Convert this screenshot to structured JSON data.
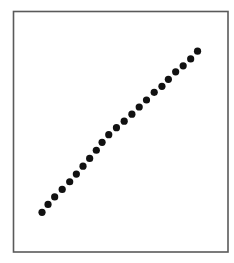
{
  "chart_data": {
    "type": "scatter",
    "title": "",
    "xlabel": "",
    "ylabel": "",
    "x_ticks": [],
    "y_ticks": [],
    "legend": [],
    "grid": false,
    "xlim": [
      0,
      1
    ],
    "ylim": [
      0,
      1
    ],
    "note": "No axes, ticks or labels are shown; values are normalized positions within the plot frame (0 = left/bottom, 1 = right/top).",
    "series": [
      {
        "name": "points",
        "color": "#111111",
        "marker": "circle",
        "points": [
          {
            "x": 0.133,
            "y": 0.165
          },
          {
            "x": 0.161,
            "y": 0.198
          },
          {
            "x": 0.192,
            "y": 0.229
          },
          {
            "x": 0.227,
            "y": 0.26
          },
          {
            "x": 0.262,
            "y": 0.292
          },
          {
            "x": 0.293,
            "y": 0.324
          },
          {
            "x": 0.324,
            "y": 0.357
          },
          {
            "x": 0.355,
            "y": 0.389
          },
          {
            "x": 0.386,
            "y": 0.423
          },
          {
            "x": 0.413,
            "y": 0.456
          },
          {
            "x": 0.444,
            "y": 0.488
          },
          {
            "x": 0.48,
            "y": 0.517
          },
          {
            "x": 0.516,
            "y": 0.544
          },
          {
            "x": 0.552,
            "y": 0.573
          },
          {
            "x": 0.586,
            "y": 0.603
          },
          {
            "x": 0.62,
            "y": 0.632
          },
          {
            "x": 0.656,
            "y": 0.664
          },
          {
            "x": 0.692,
            "y": 0.689
          },
          {
            "x": 0.722,
            "y": 0.718
          },
          {
            "x": 0.756,
            "y": 0.749
          },
          {
            "x": 0.791,
            "y": 0.774
          },
          {
            "x": 0.826,
            "y": 0.803
          },
          {
            "x": 0.858,
            "y": 0.835
          }
        ]
      }
    ]
  },
  "frame": {
    "border_color": "#5a5a5a",
    "background": "#ffffff"
  }
}
